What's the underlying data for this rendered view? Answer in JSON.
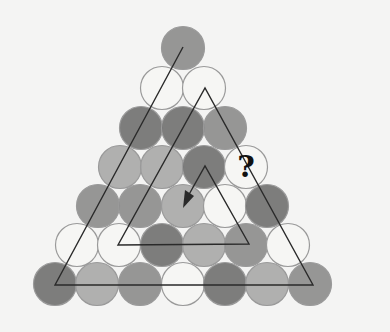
{
  "puzzle": {
    "question_mark": "?",
    "radius": 21.5,
    "colors": {
      "white": "#f6f6f4",
      "light": "#a9a9a9",
      "medium": "#8d8d8d",
      "dark": "#727272",
      "stroke": "#9a9a9a",
      "line": "#2a2a2a"
    },
    "rows": [
      {
        "y": 48,
        "cells": [
          {
            "x": 183,
            "shade": "medium"
          }
        ]
      },
      {
        "y": 88,
        "cells": [
          {
            "x": 162,
            "shade": "white"
          },
          {
            "x": 204,
            "shade": "white"
          }
        ]
      },
      {
        "y": 128,
        "cells": [
          {
            "x": 141,
            "shade": "dark"
          },
          {
            "x": 183,
            "shade": "dark"
          },
          {
            "x": 225,
            "shade": "medium"
          }
        ]
      },
      {
        "y": 167,
        "cells": [
          {
            "x": 120,
            "shade": "light"
          },
          {
            "x": 162,
            "shade": "light"
          },
          {
            "x": 204,
            "shade": "dark"
          },
          {
            "x": 246,
            "shade": "white",
            "question": true
          }
        ]
      },
      {
        "y": 206,
        "cells": [
          {
            "x": 98,
            "shade": "medium"
          },
          {
            "x": 140,
            "shade": "medium"
          },
          {
            "x": 183,
            "shade": "light"
          },
          {
            "x": 225,
            "shade": "white"
          },
          {
            "x": 267,
            "shade": "dark"
          }
        ]
      },
      {
        "y": 245,
        "cells": [
          {
            "x": 77,
            "shade": "white"
          },
          {
            "x": 119,
            "shade": "white"
          },
          {
            "x": 162,
            "shade": "dark"
          },
          {
            "x": 204,
            "shade": "light"
          },
          {
            "x": 246,
            "shade": "medium"
          },
          {
            "x": 288,
            "shade": "white"
          }
        ]
      },
      {
        "y": 284,
        "cells": [
          {
            "x": 55,
            "shade": "dark"
          },
          {
            "x": 97,
            "shade": "light"
          },
          {
            "x": 140,
            "shade": "medium"
          },
          {
            "x": 183,
            "shade": "white"
          },
          {
            "x": 225,
            "shade": "dark"
          },
          {
            "x": 267,
            "shade": "light"
          },
          {
            "x": 310,
            "shade": "medium"
          }
        ]
      }
    ],
    "spiral_path": "M183,47 L55,285 L313,285 L205,88 L118,245 L249,244 L205,166 L187,198"
  }
}
